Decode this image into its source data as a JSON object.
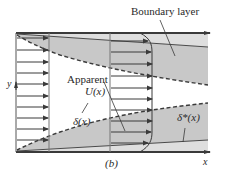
{
  "figure": {
    "caption": "(b)",
    "labels": {
      "boundary_layer": "Boundary layer",
      "apparent": "Apparent",
      "apparent_u": "U(x)",
      "delta": "δ(x)",
      "delta_star": "δ*(x)",
      "y_axis": "y",
      "x_axis": "x"
    },
    "colors": {
      "line": "#3a3a3a",
      "shade_dark": "#c8c8c8",
      "shade_light": "#dedede",
      "background": "#ffffff"
    }
  }
}
